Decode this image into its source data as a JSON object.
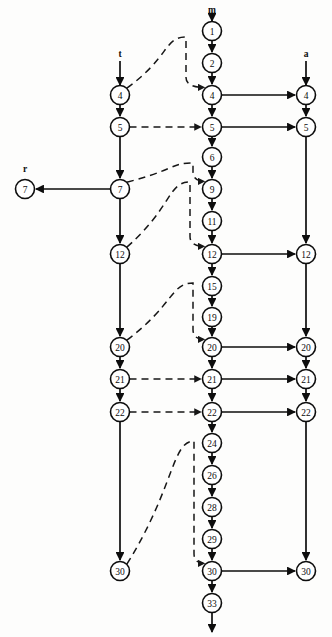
{
  "diagram": {
    "type": "directed-graph",
    "width": 332,
    "height": 637,
    "colors": {
      "stroke": "#0d0d0d",
      "node_fill": "#ffffff",
      "background": "#fdfdfc"
    },
    "column_labels": [
      {
        "id": "label-t",
        "text": "t",
        "x": 120,
        "y": 57
      },
      {
        "id": "label-m",
        "text": "m",
        "x": 212,
        "y": 13
      },
      {
        "id": "label-a",
        "text": "a",
        "x": 306,
        "y": 57
      },
      {
        "id": "label-r",
        "text": "r",
        "x": 25,
        "y": 172
      }
    ],
    "columns": [
      {
        "id": "col-r",
        "x": 25,
        "label": "r"
      },
      {
        "id": "col-t",
        "x": 120,
        "label": "t"
      },
      {
        "id": "col-m",
        "x": 212,
        "label": "m"
      },
      {
        "id": "col-a",
        "x": 306,
        "label": "a"
      }
    ],
    "node_radius": 9.5,
    "nodes": [
      {
        "id": "r-7",
        "column": "r",
        "label": "7",
        "x": 25,
        "y": 189
      },
      {
        "id": "t-4",
        "column": "t",
        "label": "4",
        "x": 120,
        "y": 95
      },
      {
        "id": "t-5",
        "column": "t",
        "label": "5",
        "x": 120,
        "y": 127
      },
      {
        "id": "t-7",
        "column": "t",
        "label": "7",
        "x": 120,
        "y": 189
      },
      {
        "id": "t-12",
        "column": "t",
        "label": "12",
        "x": 120,
        "y": 254
      },
      {
        "id": "t-20",
        "column": "t",
        "label": "20",
        "x": 120,
        "y": 347
      },
      {
        "id": "t-21",
        "column": "t",
        "label": "21",
        "x": 120,
        "y": 379
      },
      {
        "id": "t-22",
        "column": "t",
        "label": "22",
        "x": 120,
        "y": 412
      },
      {
        "id": "t-30",
        "column": "t",
        "label": "30",
        "x": 120,
        "y": 571
      },
      {
        "id": "m-1",
        "column": "m",
        "label": "1",
        "x": 212,
        "y": 31
      },
      {
        "id": "m-2",
        "column": "m",
        "label": "2",
        "x": 212,
        "y": 63
      },
      {
        "id": "m-4",
        "column": "m",
        "label": "4",
        "x": 212,
        "y": 95
      },
      {
        "id": "m-5",
        "column": "m",
        "label": "5",
        "x": 212,
        "y": 127
      },
      {
        "id": "m-6",
        "column": "m",
        "label": "6",
        "x": 212,
        "y": 157
      },
      {
        "id": "m-9",
        "column": "m",
        "label": "9",
        "x": 212,
        "y": 189
      },
      {
        "id": "m-11",
        "column": "m",
        "label": "11",
        "x": 212,
        "y": 221
      },
      {
        "id": "m-12",
        "column": "m",
        "label": "12",
        "x": 212,
        "y": 254
      },
      {
        "id": "m-15",
        "column": "m",
        "label": "15",
        "x": 212,
        "y": 286
      },
      {
        "id": "m-19",
        "column": "m",
        "label": "19",
        "x": 212,
        "y": 317
      },
      {
        "id": "m-20",
        "column": "m",
        "label": "20",
        "x": 212,
        "y": 347
      },
      {
        "id": "m-21",
        "column": "m",
        "label": "21",
        "x": 212,
        "y": 379
      },
      {
        "id": "m-22",
        "column": "m",
        "label": "22",
        "x": 212,
        "y": 412
      },
      {
        "id": "m-24",
        "column": "m",
        "label": "24",
        "x": 212,
        "y": 443
      },
      {
        "id": "m-26",
        "column": "m",
        "label": "26",
        "x": 212,
        "y": 475
      },
      {
        "id": "m-28",
        "column": "m",
        "label": "28",
        "x": 212,
        "y": 507
      },
      {
        "id": "m-29",
        "column": "m",
        "label": "29",
        "x": 212,
        "y": 539
      },
      {
        "id": "m-30",
        "column": "m",
        "label": "30",
        "x": 212,
        "y": 571
      },
      {
        "id": "m-33",
        "column": "m",
        "label": "33",
        "x": 212,
        "y": 603
      },
      {
        "id": "a-4",
        "column": "a",
        "label": "4",
        "x": 306,
        "y": 95
      },
      {
        "id": "a-5",
        "column": "a",
        "label": "5",
        "x": 306,
        "y": 127
      },
      {
        "id": "a-12",
        "column": "a",
        "label": "12",
        "x": 306,
        "y": 254
      },
      {
        "id": "a-20",
        "column": "a",
        "label": "20",
        "x": 306,
        "y": 347
      },
      {
        "id": "a-21",
        "column": "a",
        "label": "21",
        "x": 306,
        "y": 379
      },
      {
        "id": "a-22",
        "column": "a",
        "label": "22",
        "x": 306,
        "y": 412
      },
      {
        "id": "a-30",
        "column": "a",
        "label": "30",
        "x": 306,
        "y": 571
      }
    ],
    "entry_arrows": [
      {
        "id": "entry-m",
        "x": 212,
        "from_y": 17,
        "to_y": 21
      },
      {
        "id": "entry-t",
        "x": 120,
        "from_y": 61,
        "to_y": 85
      },
      {
        "id": "entry-a",
        "x": 306,
        "from_y": 61,
        "to_y": 85
      }
    ],
    "exit_arrows": [
      {
        "id": "exit-m",
        "x": 212,
        "from_y": 613,
        "to_y": 632
      }
    ],
    "vertical_edges": [
      {
        "id": "e-m1-m2",
        "from": "m-1",
        "to": "m-2"
      },
      {
        "id": "e-m2-m4",
        "from": "m-2",
        "to": "m-4"
      },
      {
        "id": "e-m4-m5",
        "from": "m-4",
        "to": "m-5"
      },
      {
        "id": "e-m5-m6",
        "from": "m-5",
        "to": "m-6"
      },
      {
        "id": "e-m6-m9",
        "from": "m-6",
        "to": "m-9"
      },
      {
        "id": "e-m9-m11",
        "from": "m-9",
        "to": "m-11"
      },
      {
        "id": "e-m11-m12",
        "from": "m-11",
        "to": "m-12"
      },
      {
        "id": "e-m12-m15",
        "from": "m-12",
        "to": "m-15"
      },
      {
        "id": "e-m15-m19",
        "from": "m-15",
        "to": "m-19"
      },
      {
        "id": "e-m19-m20",
        "from": "m-19",
        "to": "m-20"
      },
      {
        "id": "e-m20-m21",
        "from": "m-20",
        "to": "m-21"
      },
      {
        "id": "e-m21-m22",
        "from": "m-21",
        "to": "m-22"
      },
      {
        "id": "e-m22-m24",
        "from": "m-22",
        "to": "m-24"
      },
      {
        "id": "e-m24-m26",
        "from": "m-24",
        "to": "m-26"
      },
      {
        "id": "e-m26-m28",
        "from": "m-26",
        "to": "m-28"
      },
      {
        "id": "e-m28-m29",
        "from": "m-28",
        "to": "m-29"
      },
      {
        "id": "e-m29-m30",
        "from": "m-29",
        "to": "m-30"
      },
      {
        "id": "e-m30-m33",
        "from": "m-30",
        "to": "m-33"
      },
      {
        "id": "e-t4-t5",
        "from": "t-4",
        "to": "t-5"
      },
      {
        "id": "e-t5-t7",
        "from": "t-5",
        "to": "t-7"
      },
      {
        "id": "e-t7-t12",
        "from": "t-7",
        "to": "t-12"
      },
      {
        "id": "e-t12-t20",
        "from": "t-12",
        "to": "t-20"
      },
      {
        "id": "e-t20-t21",
        "from": "t-20",
        "to": "t-21"
      },
      {
        "id": "e-t21-t22",
        "from": "t-21",
        "to": "t-22"
      },
      {
        "id": "e-t22-t30",
        "from": "t-22",
        "to": "t-30"
      },
      {
        "id": "e-a4-a5",
        "from": "a-4",
        "to": "a-5"
      },
      {
        "id": "e-a5-a12",
        "from": "a-5",
        "to": "a-12"
      },
      {
        "id": "e-a12-a20",
        "from": "a-12",
        "to": "a-20"
      },
      {
        "id": "e-a20-a21",
        "from": "a-20",
        "to": "a-21"
      },
      {
        "id": "e-a21-a22",
        "from": "a-21",
        "to": "a-22"
      },
      {
        "id": "e-a22-a30",
        "from": "a-22",
        "to": "a-30"
      }
    ],
    "horizontal_solid_edges": [
      {
        "id": "h-m4-a4",
        "from": "m-4",
        "to": "a-4"
      },
      {
        "id": "h-m5-a5",
        "from": "m-5",
        "to": "a-5"
      },
      {
        "id": "h-m12-a12",
        "from": "m-12",
        "to": "a-12"
      },
      {
        "id": "h-m20-a20",
        "from": "m-20",
        "to": "a-20"
      },
      {
        "id": "h-m21-a21",
        "from": "m-21",
        "to": "a-21"
      },
      {
        "id": "h-m22-a22",
        "from": "m-22",
        "to": "a-22"
      },
      {
        "id": "h-m30-a30",
        "from": "m-30",
        "to": "a-30"
      },
      {
        "id": "h-t7-r7",
        "from": "t-7",
        "to": "r-7",
        "direction": "left"
      }
    ],
    "horizontal_dashed_edges": [
      {
        "id": "d-t5-m5",
        "from": "t-5",
        "to": "m-5"
      },
      {
        "id": "d-t21-m21",
        "from": "t-21",
        "to": "m-21"
      },
      {
        "id": "d-t22-m22",
        "from": "t-22",
        "to": "m-22"
      }
    ],
    "curved_dashed_edges": [
      {
        "id": "c-t4-m4",
        "from": "t-4",
        "to": "m-4",
        "peak_x": 186,
        "peak_y": 37
      },
      {
        "id": "c-t7-m9",
        "from": "t-7",
        "to": "m-9",
        "peak_x": 193,
        "peak_y": 163
      },
      {
        "id": "c-t12-m12",
        "from": "t-12",
        "to": "m-12",
        "peak_x": 190,
        "peak_y": 182
      },
      {
        "id": "c-t20-m20",
        "from": "t-20",
        "to": "m-20",
        "peak_x": 193,
        "peak_y": 283
      },
      {
        "id": "c-t30-m30",
        "from": "t-30",
        "to": "m-30",
        "peak_x": 194,
        "peak_y": 441
      }
    ]
  }
}
